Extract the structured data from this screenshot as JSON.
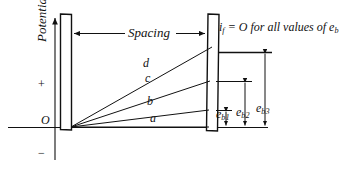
{
  "figure": {
    "type": "potential-distribution-diagram",
    "ink_color": "#111111",
    "background": "#ffffff",
    "plate_fill": "#ffffff"
  },
  "axis": {
    "y_label": "Potential",
    "origin_label": "O",
    "plus_label": "+",
    "minus_label": "−",
    "arrow_direction": "up"
  },
  "annotations": {
    "spacing_label": "Spacing",
    "note_prefix": "i",
    "note_prefix_sub": "f",
    "note_body": " = O  for all values of e",
    "note_body_sub": "b"
  },
  "curves": [
    {
      "id": "a",
      "label": "a",
      "end_y": 127,
      "label_x": 150,
      "label_y": 119
    },
    {
      "id": "b",
      "label": "b",
      "end_y": 110,
      "label_x": 147,
      "label_y": 101
    },
    {
      "id": "c",
      "label": "c",
      "end_y": 81,
      "label_x": 145,
      "label_y": 79
    },
    {
      "id": "d",
      "label": "d",
      "end_y": 47,
      "label_x": 143,
      "label_y": 64
    }
  ],
  "voltages": [
    {
      "id": "eb1",
      "base": "e",
      "sub": "b1",
      "top_y": 110,
      "label_x": 218,
      "label_y": 113
    },
    {
      "id": "eb2",
      "base": "e",
      "sub": "b2",
      "top_y": 81,
      "label_x": 238,
      "label_y": 111
    },
    {
      "id": "eb3",
      "base": "e",
      "sub": "b3",
      "top_y": 52,
      "label_x": 258,
      "label_y": 107
    }
  ],
  "geometry": {
    "baseline_y": 127,
    "left_plate_x": 60,
    "right_plate_x": 207,
    "plate_top_y": 14,
    "plate_width": 11
  }
}
